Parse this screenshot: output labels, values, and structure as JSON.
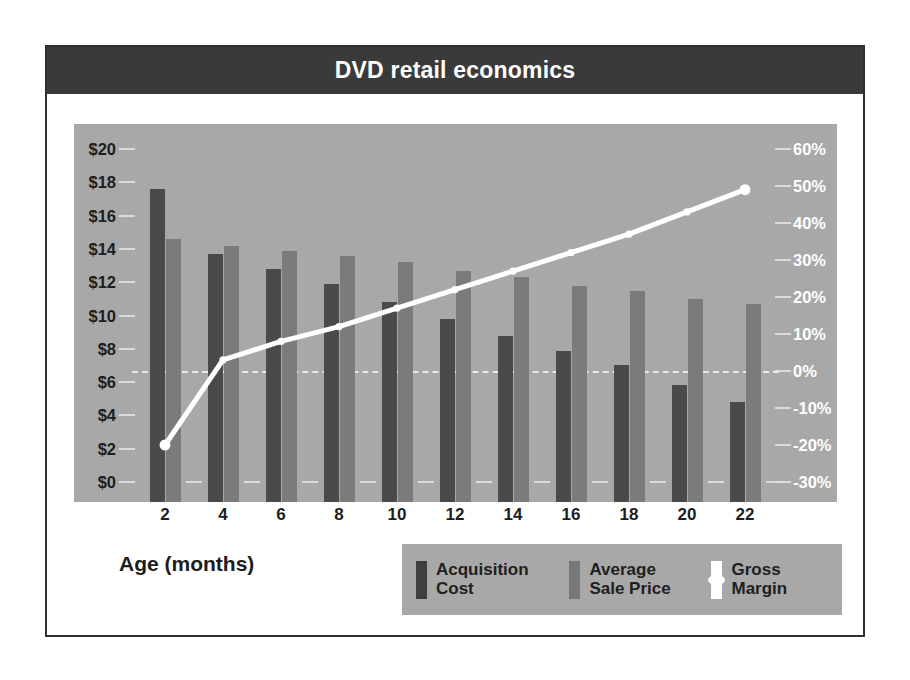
{
  "header": {
    "title": "DVD retail economics"
  },
  "axis": {
    "x_title": "Age (months)",
    "x_labels": [
      "2",
      "4",
      "6",
      "8",
      "10",
      "12",
      "14",
      "16",
      "18",
      "20",
      "22"
    ],
    "y_left_labels": [
      "$20",
      "$18",
      "$16",
      "$14",
      "$12",
      "$10",
      "$8",
      "$6",
      "$4",
      "$2",
      "$0"
    ],
    "y_right_labels": [
      "60%",
      "50%",
      "40%",
      "30%",
      "20%",
      "10%",
      "0%",
      "-10%",
      "-20%",
      "-30%"
    ]
  },
  "legend": {
    "items": [
      {
        "label": "Acquisition\nCost",
        "swatch": "bar-dark",
        "color": "#3f3f3f"
      },
      {
        "label": "Average\nSale Price",
        "swatch": "bar-gray",
        "color": "#787878"
      },
      {
        "label": "Gross\nMargin",
        "swatch": "line-white",
        "color": "#ffffff"
      }
    ]
  },
  "colors": {
    "title_bar": "#3a3a3a",
    "plot_background": "#a8a8a8",
    "acquisition_cost": "#4a4a4a",
    "average_sale_price": "#7b7b7b",
    "gross_margin_line": "#ffffff",
    "card_background": "#ffffff",
    "card_border": "#2f2f2f"
  },
  "chart_data": {
    "type": "bar",
    "title": "DVD retail economics",
    "xlabel": "Age (months)",
    "ylabel": "",
    "categories": [
      2,
      4,
      6,
      8,
      10,
      12,
      14,
      16,
      18,
      20,
      22
    ],
    "ylim": [
      0,
      20
    ],
    "y2lim": [
      -30,
      60
    ],
    "grid": true,
    "legend_position": "bottom-right",
    "series": [
      {
        "name": "Acquisition Cost",
        "type": "bar",
        "axis": "left",
        "unit": "USD",
        "values": [
          18.8,
          14.9,
          14.0,
          13.1,
          12.0,
          11.0,
          10.0,
          9.1,
          8.2,
          7.0,
          6.0
        ]
      },
      {
        "name": "Average Sale Price",
        "type": "bar",
        "axis": "left",
        "unit": "USD",
        "values": [
          15.8,
          15.4,
          15.1,
          14.8,
          14.4,
          13.9,
          13.5,
          13.0,
          12.7,
          12.2,
          11.9
        ]
      },
      {
        "name": "Gross Margin",
        "type": "line",
        "axis": "right",
        "unit": "percent",
        "values": [
          -20,
          3,
          8,
          12,
          17,
          22,
          27,
          32,
          37,
          43,
          49
        ]
      }
    ]
  }
}
